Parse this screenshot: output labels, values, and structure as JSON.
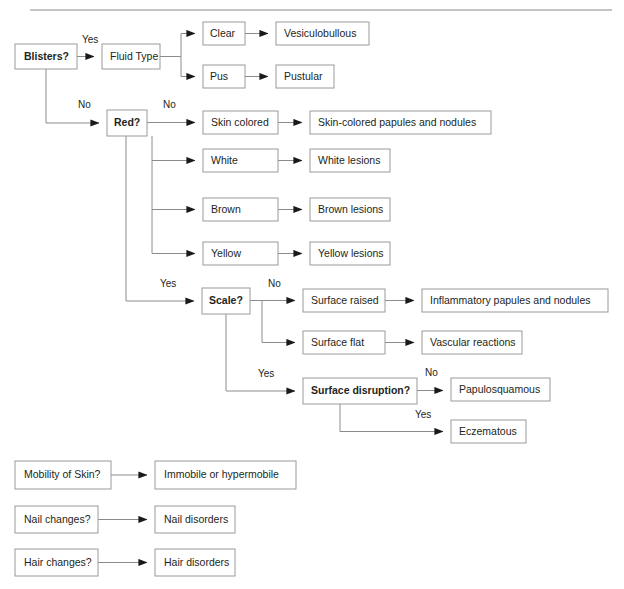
{
  "page": {
    "background_color": "#ffffff",
    "box_border_color": "#9a9a9a",
    "line_color": "#8c8c8c",
    "text_color": "#231f20",
    "width": 624,
    "height": 589
  },
  "rule": {
    "present": true,
    "y": 10
  },
  "nodes": {
    "blisters": {
      "label": "Blisters?",
      "bold": true,
      "x": 15,
      "y": 44,
      "w": 62,
      "h": 25
    },
    "fluid_type": {
      "label": "Fluid Type",
      "bold": false,
      "x": 102,
      "y": 44,
      "w": 58,
      "h": 25
    },
    "clear": {
      "label": "Clear",
      "bold": false,
      "x": 203,
      "y": 22,
      "w": 42,
      "h": 23
    },
    "vesiculobullous": {
      "label": "Vesiculobullous",
      "bold": false,
      "x": 276,
      "y": 22,
      "w": 93,
      "h": 23
    },
    "pus": {
      "label": "Pus",
      "bold": false,
      "x": 203,
      "y": 65,
      "w": 42,
      "h": 23
    },
    "pustular": {
      "label": "Pustular",
      "bold": false,
      "x": 276,
      "y": 65,
      "w": 58,
      "h": 23
    },
    "red": {
      "label": "Red?",
      "bold": true,
      "x": 107,
      "y": 110,
      "w": 40,
      "h": 26
    },
    "skin_colored": {
      "label": "Skin colored",
      "bold": false,
      "x": 203,
      "y": 111,
      "w": 75,
      "h": 23
    },
    "skin_colored_papules": {
      "label": "Skin-colored papules and nodules",
      "bold": false,
      "x": 310,
      "y": 111,
      "w": 181,
      "h": 23
    },
    "white": {
      "label": "White",
      "bold": false,
      "x": 203,
      "y": 149,
      "w": 75,
      "h": 23
    },
    "white_lesions": {
      "label": "White lesions",
      "bold": false,
      "x": 310,
      "y": 149,
      "w": 80,
      "h": 23
    },
    "brown": {
      "label": "Brown",
      "bold": false,
      "x": 203,
      "y": 198,
      "w": 75,
      "h": 23
    },
    "brown_lesions": {
      "label": "Brown lesions",
      "bold": false,
      "x": 310,
      "y": 198,
      "w": 80,
      "h": 23
    },
    "yellow": {
      "label": "Yellow",
      "bold": false,
      "x": 203,
      "y": 242,
      "w": 75,
      "h": 23
    },
    "yellow_lesions": {
      "label": "Yellow lesions",
      "bold": false,
      "x": 310,
      "y": 242,
      "w": 80,
      "h": 23
    },
    "scale": {
      "label": "Scale?",
      "bold": true,
      "x": 202,
      "y": 288,
      "w": 48,
      "h": 26
    },
    "surface_raised": {
      "label": "Surface raised",
      "bold": false,
      "x": 303,
      "y": 289,
      "w": 82,
      "h": 23
    },
    "inflammatory": {
      "label": "Inflammatory papules and nodules",
      "bold": false,
      "x": 422,
      "y": 289,
      "w": 186,
      "h": 23
    },
    "surface_flat": {
      "label": "Surface flat",
      "bold": false,
      "x": 303,
      "y": 331,
      "w": 82,
      "h": 23
    },
    "vascular": {
      "label": "Vascular reactions",
      "bold": false,
      "x": 422,
      "y": 331,
      "w": 100,
      "h": 23
    },
    "surface_disruption": {
      "label": "Surface disruption?",
      "bold": true,
      "x": 303,
      "y": 378,
      "w": 114,
      "h": 26
    },
    "papulosquamous": {
      "label": "Papulosquamous",
      "bold": false,
      "x": 451,
      "y": 378,
      "w": 99,
      "h": 23
    },
    "eczematous": {
      "label": "Eczematous",
      "bold": false,
      "x": 451,
      "y": 420,
      "w": 75,
      "h": 23
    },
    "mobility_of_skin": {
      "label": "Mobility of Skin?",
      "bold": false,
      "x": 15,
      "y": 461,
      "w": 96,
      "h": 28
    },
    "immobile": {
      "label": "Immobile or hypermobile",
      "bold": false,
      "x": 155,
      "y": 461,
      "w": 141,
      "h": 28
    },
    "nail_changes": {
      "label": "Nail changes?",
      "bold": false,
      "x": 15,
      "y": 506,
      "w": 83,
      "h": 27
    },
    "nail_disorders": {
      "label": "Nail disorders",
      "bold": false,
      "x": 155,
      "y": 506,
      "w": 80,
      "h": 27
    },
    "hair_changes": {
      "label": "Hair changes?",
      "bold": false,
      "x": 15,
      "y": 549,
      "w": 83,
      "h": 27
    },
    "hair_disorders": {
      "label": "Hair disorders",
      "bold": false,
      "x": 155,
      "y": 549,
      "w": 80,
      "h": 27
    }
  },
  "edge_labels": [
    {
      "text": "Yes",
      "x": 82,
      "y": 40,
      "name": "edge-label-blisters-yes"
    },
    {
      "text": "No",
      "x": 78,
      "y": 105,
      "name": "edge-label-blisters-no"
    },
    {
      "text": "No",
      "x": 163,
      "y": 105,
      "name": "edge-label-red-no"
    },
    {
      "text": "Yes",
      "x": 160,
      "y": 284,
      "name": "edge-label-red-yes"
    },
    {
      "text": "No",
      "x": 268,
      "y": 284,
      "name": "edge-label-scale-no"
    },
    {
      "text": "Yes",
      "x": 258,
      "y": 374,
      "name": "edge-label-scale-yes"
    },
    {
      "text": "No",
      "x": 425,
      "y": 373,
      "name": "edge-label-disruption-no"
    },
    {
      "text": "Yes",
      "x": 415,
      "y": 415,
      "name": "edge-label-disruption-yes"
    }
  ]
}
